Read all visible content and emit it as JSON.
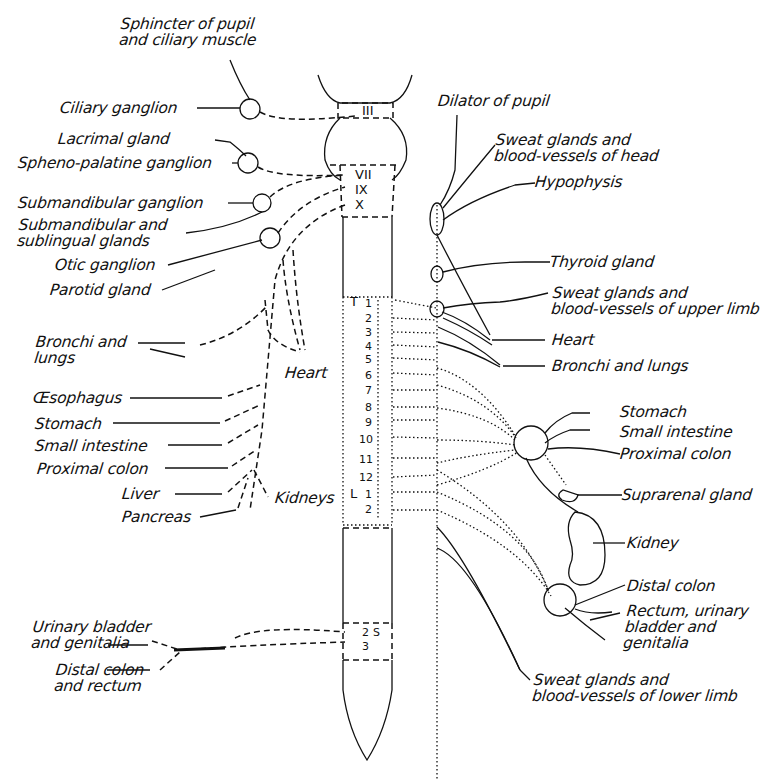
{
  "diagram": {
    "type": "autonomic-nervous-system",
    "parasympathetic_labels": {
      "sphincter": "Sphincter of pupil\nand ciliary muscle",
      "ciliary_ganglion": "Ciliary ganglion",
      "lacrimal_gland": "Lacrimal gland",
      "spheno_palatine": "Spheno-palatine ganglion",
      "submandibular_ganglion": "Submandibular ganglion",
      "submandibular_glands": "Submandibular and\nsublingual glands",
      "otic_ganglion": "Otic ganglion",
      "parotid_gland": "Parotid gland",
      "bronchi": "Bronchi and\nlungs",
      "heart": "Heart",
      "oesophagus": "Œsophagus",
      "stomach": "Stomach",
      "small_intestine": "Small intestine",
      "proximal_colon": "Proximal colon",
      "liver": "Liver",
      "pancreas": "Pancreas",
      "kidneys": "Kidneys",
      "urinary": "Urinary bladder\nand genitalia",
      "distal_colon_rectum": "Distal colon\nand rectum"
    },
    "sympathetic_labels": {
      "dilator": "Dilator of pupil",
      "sweat_head": "Sweat glands and\nblood-vessels of head",
      "hypophysis": "Hypophysis",
      "thyroid": "Thyroid gland",
      "sweat_upper": "Sweat glands and\nblood-vessels of upper limb",
      "heart": "Heart",
      "bronchi": "Bronchi and lungs",
      "stomach": "Stomach",
      "small_intestine": "Small intestine",
      "proximal_colon": "Proximal colon",
      "suprarenal": "Suprarenal gland",
      "kidney": "Kidney",
      "distal_colon": "Distal colon",
      "rectum": "Rectum, urinary\nbladder and\ngenitalia",
      "sweat_lower": "Sweat glands and\nblood-vessels of lower limb"
    },
    "cranial_nerves": [
      "III",
      "VII",
      "IX",
      "X"
    ],
    "thoracic_prefix": "T",
    "lumbar_prefix": "L",
    "thoracic_segments": [
      "1",
      "2",
      "3",
      "4",
      "5",
      "6",
      "7",
      "8",
      "9",
      "10",
      "11",
      "12"
    ],
    "lumbar_segments": [
      "1",
      "2"
    ],
    "sacral_segments": [
      "2",
      "3"
    ]
  }
}
